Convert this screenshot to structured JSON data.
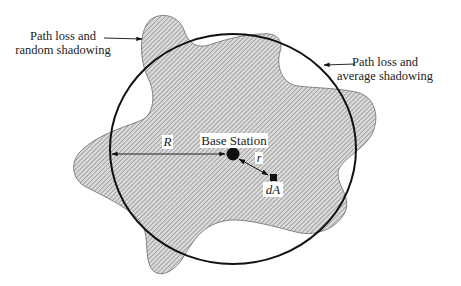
{
  "diagram": {
    "type": "cell-coverage-figure",
    "labels": {
      "random_shadowing_line1": "Path loss and",
      "random_shadowing_line2": "random shadowing",
      "average_shadowing_line1": "Path loss and",
      "average_shadowing_line2": "average shadowing",
      "base_station": "Base Station",
      "radius": "R",
      "distance": "r",
      "area_element": "dA"
    },
    "elements": {
      "coverage_circle": {
        "cx": 233,
        "cy": 149,
        "rx": 123,
        "ry": 115
      },
      "base_station": {
        "cx": 233,
        "cy": 154,
        "r": 6
      },
      "area_element": {
        "x": 270,
        "y": 174,
        "size": 7
      }
    },
    "colors": {
      "stroke": "#111111",
      "hatch": "#555555",
      "blob_fill": "#d6d6d6",
      "text": "#222222"
    }
  }
}
